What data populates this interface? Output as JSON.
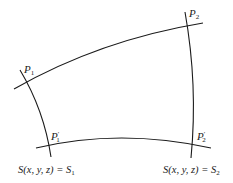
{
  "diagram": {
    "points": [
      {
        "id": "P1",
        "base": "P",
        "sub": "1",
        "prime": ""
      },
      {
        "id": "P2",
        "base": "P",
        "sub": "2",
        "prime": ""
      },
      {
        "id": "P1p",
        "base": "P",
        "sub": "1",
        "prime": "′"
      },
      {
        "id": "P2p",
        "base": "P",
        "sub": "2",
        "prime": "′"
      }
    ],
    "surfaces": [
      {
        "id": "S1",
        "lhs": "S(x, y, z) = S",
        "sub": "1"
      },
      {
        "id": "S2",
        "lhs": "S(x, y, z) = S",
        "sub": "2"
      }
    ],
    "colors": {
      "stroke": "#1a1a1a",
      "background": "#ffffff"
    }
  }
}
